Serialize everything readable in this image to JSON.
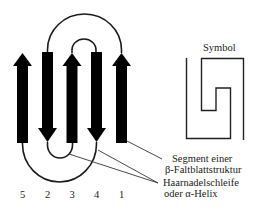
{
  "symbol_title": "Symbol",
  "strand_numbers": [
    "5",
    "2",
    "3",
    "4",
    "1"
  ],
  "labels": {
    "segment_line1": "Segment einer",
    "segment_line2": "β-Faltblattstruktur",
    "hairpin_line1": "Haarnadelschleife",
    "hairpin_line2": "oder α-Helix"
  },
  "colors": {
    "strand": "#000000",
    "line": "#1a1a1a",
    "background": "#ffffff"
  }
}
